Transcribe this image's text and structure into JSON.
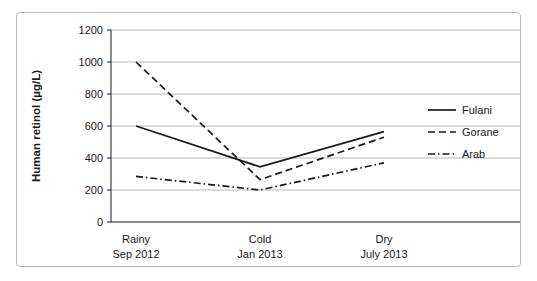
{
  "chart_data": {
    "type": "line",
    "title": "",
    "xlabel": "",
    "ylabel": "Human retinol (µg/L)",
    "categories": [
      "Rainy",
      "Cold",
      "Dry"
    ],
    "category_sublabels": [
      "Sep 2012",
      "Jan 2013",
      "July 2013"
    ],
    "ylim": [
      0,
      1200
    ],
    "yticks": [
      0,
      200,
      400,
      600,
      800,
      1000,
      1200
    ],
    "ytick_labels": [
      "0",
      "200",
      "400",
      "600",
      "800",
      "1000",
      "1200"
    ],
    "grid": "horizontal",
    "legend_position": "right",
    "series": [
      {
        "name": "Fulani",
        "values": [
          600,
          345,
          565
        ],
        "style": "solid",
        "color": "#1a1a1a"
      },
      {
        "name": "Gorane",
        "values": [
          1000,
          265,
          530
        ],
        "style": "dashed",
        "color": "#1a1a1a"
      },
      {
        "name": "Arab",
        "values": [
          285,
          200,
          370
        ],
        "style": "dash-dot",
        "color": "#1a1a1a"
      }
    ]
  },
  "colors": {
    "axis": "#1a1a1a",
    "grid": "#b0b0b0",
    "frame": "#b9b9b9",
    "background": "#ffffff"
  },
  "legend": {
    "items": [
      {
        "label": "Fulani"
      },
      {
        "label": "Gorane"
      },
      {
        "label": "Arab"
      }
    ]
  },
  "axes": {
    "y": {
      "label": "Human retinol (µg/L)",
      "ticks": [
        "1200",
        "1000",
        "800",
        "600",
        "400",
        "200",
        "0"
      ]
    },
    "x": {
      "ticks": [
        {
          "top": "Rainy",
          "bottom": "Sep 2012"
        },
        {
          "top": "Cold",
          "bottom": "Jan 2013"
        },
        {
          "top": "Dry",
          "bottom": "July 2013"
        }
      ]
    }
  }
}
